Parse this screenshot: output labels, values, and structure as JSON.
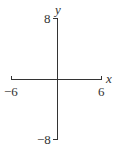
{
  "diagram": {
    "type": "coordinate-axes",
    "x_axis": {
      "label": "x",
      "min": -6,
      "max": 6,
      "min_label": "−6",
      "max_label": "6"
    },
    "y_axis": {
      "label": "y",
      "min": -8,
      "max": 8,
      "min_label": "−8",
      "max_label": "8"
    },
    "colors": {
      "axis": "#333333",
      "background": "#ffffff"
    }
  }
}
